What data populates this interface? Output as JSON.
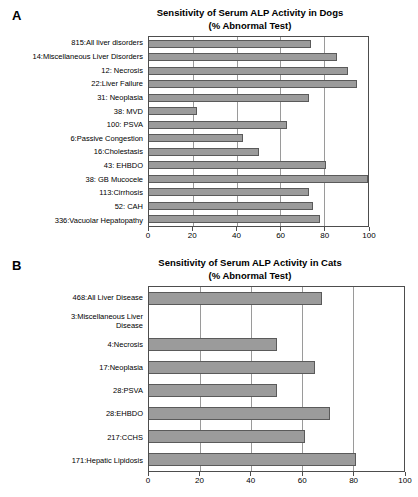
{
  "figure": {
    "panels": [
      {
        "letter": "A",
        "title_line1": "Sensitivity of Serum ALP Activity in Dogs",
        "title_line2": "(% Abnormal Test)"
      },
      {
        "letter": "B",
        "title_line1": "Sensitivity of Serum ALP Activity in Cats",
        "title_line2": "(% Abnormal Test)"
      }
    ]
  },
  "chart_data": [
    {
      "type": "bar",
      "orientation": "horizontal",
      "panel": "A",
      "title": "Sensitivity of Serum ALP Activity in Dogs (% Abnormal Test)",
      "xlabel": "",
      "ylabel": "",
      "xlim": [
        0,
        100
      ],
      "xticks": [
        0,
        20,
        40,
        60,
        80,
        100
      ],
      "xticklabels": [
        "0",
        "20",
        "40",
        "60",
        "80",
        "100"
      ],
      "grid": true,
      "legend": "none",
      "bar_color": "#9b9b9b",
      "bar_edge_color": "#5a5a5a",
      "categories": [
        "815:All liver disorders",
        "14:Miscellaneous Liver Disorders",
        "12: Necrosis",
        "22:Liver Failure",
        "31: Neoplasia",
        "38: MVD",
        "100: PSVA",
        "6:Passive Congestion",
        "16:Cholestasis",
        "43: EHBDO",
        "38: GB Mucocele",
        "113:Cirrhosis",
        "52: CAH",
        "336:Vacuolar Hepatopathy"
      ],
      "values": [
        74,
        86,
        91,
        95,
        73,
        22,
        63,
        43,
        50,
        81,
        100,
        73,
        75,
        78
      ]
    },
    {
      "type": "bar",
      "orientation": "horizontal",
      "panel": "B",
      "title": "Sensitivity of Serum ALP Activity in Cats (% Abnormal Test)",
      "xlabel": "",
      "ylabel": "",
      "xlim": [
        0,
        100
      ],
      "xticks": [
        0,
        20,
        40,
        60,
        80,
        100
      ],
      "xticklabels": [
        "0",
        "20",
        "40",
        "60",
        "80",
        "100"
      ],
      "grid": true,
      "legend": "none",
      "bar_color": "#9b9b9b",
      "bar_edge_color": "#5a5a5a",
      "categories": [
        "468:All Liver Disease",
        "3:Miscellaneous Liver\nDisease",
        "4:Necrosis",
        "17:Neoplasia",
        "28:PSVA",
        "28:EHBDO",
        "217:CCHS",
        "171:Hepatic Lipidosis"
      ],
      "values": [
        68,
        0,
        50,
        65,
        50,
        71,
        61,
        81
      ]
    }
  ]
}
